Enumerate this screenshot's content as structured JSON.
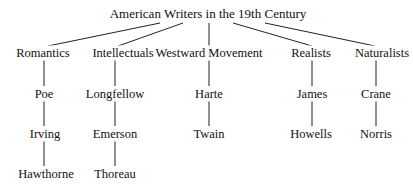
{
  "title": "American Writers in the 19th Century",
  "groups": [
    {
      "label": "Romantics",
      "members": [
        "Poe",
        "Irving",
        "Hawthorne"
      ]
    },
    {
      "label": "Intellectuals",
      "members": [
        "Longfellow",
        "Emerson",
        "Thoreau"
      ]
    },
    {
      "label": "Westward Movement",
      "members": [
        "Harte",
        "Twain"
      ]
    },
    {
      "label": "Realists",
      "members": [
        "James",
        "Howells"
      ]
    },
    {
      "label": "Naturalists",
      "members": [
        "Crane",
        "Norris"
      ]
    }
  ]
}
